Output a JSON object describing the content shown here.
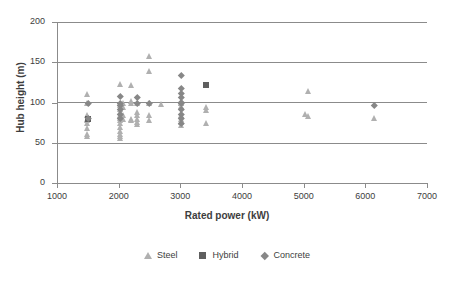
{
  "chart_data": {
    "type": "scatter",
    "title": "",
    "xlabel": "Rated power (kW)",
    "ylabel": "Hub height (m)",
    "xlim": [
      1000,
      7000
    ],
    "ylim": [
      0,
      200
    ],
    "xticks": [
      1000,
      2000,
      3000,
      4000,
      5000,
      6000,
      7000
    ],
    "yticks": [
      0,
      50,
      100,
      150,
      200
    ],
    "xtick_labels": [
      "1000",
      "2000",
      "3000",
      "4000",
      "5000",
      "6000",
      "7000"
    ],
    "ytick_labels": [
      "0",
      "50",
      "100",
      "150",
      "200"
    ],
    "grid": "horizontal",
    "legend_position": "bottom",
    "series": [
      {
        "name": "Steel",
        "marker": "triangle",
        "color": "#b0b0b0",
        "points": [
          [
            1500,
            110
          ],
          [
            1500,
            99
          ],
          [
            1500,
            85
          ],
          [
            1500,
            80
          ],
          [
            1500,
            78
          ],
          [
            1500,
            74
          ],
          [
            1500,
            68
          ],
          [
            1500,
            61
          ],
          [
            1500,
            59
          ],
          [
            2020,
            123
          ],
          [
            2020,
            100
          ],
          [
            2020,
            97
          ],
          [
            2020,
            92
          ],
          [
            2020,
            88
          ],
          [
            2020,
            85
          ],
          [
            2020,
            81
          ],
          [
            2020,
            78
          ],
          [
            2020,
            74
          ],
          [
            2020,
            69
          ],
          [
            2020,
            64
          ],
          [
            2020,
            61
          ],
          [
            2020,
            58
          ],
          [
            2020,
            56
          ],
          [
            2080,
            99
          ],
          [
            2080,
            94
          ],
          [
            2080,
            85
          ],
          [
            2080,
            80
          ],
          [
            2200,
            122
          ],
          [
            2200,
            102
          ],
          [
            2200,
            99
          ],
          [
            2200,
            80
          ],
          [
            2200,
            78
          ],
          [
            2300,
            99
          ],
          [
            2300,
            88
          ],
          [
            2300,
            85
          ],
          [
            2300,
            80
          ],
          [
            2300,
            76
          ],
          [
            2300,
            73
          ],
          [
            2500,
            158
          ],
          [
            2500,
            139
          ],
          [
            2500,
            99
          ],
          [
            2500,
            85
          ],
          [
            2500,
            78
          ],
          [
            2700,
            98
          ],
          [
            3020,
            100
          ],
          [
            3020,
            99
          ],
          [
            3020,
            96
          ],
          [
            3020,
            85
          ],
          [
            3020,
            80
          ],
          [
            3020,
            76
          ],
          [
            3020,
            72
          ],
          [
            3420,
            94
          ],
          [
            3420,
            91
          ],
          [
            3420,
            75
          ],
          [
            5080,
            114
          ],
          [
            5030,
            86
          ],
          [
            5080,
            83
          ],
          [
            6150,
            81
          ]
        ]
      },
      {
        "name": "Hybrid",
        "marker": "square",
        "color": "#5f5f5f",
        "points": [
          [
            1500,
            80
          ],
          [
            3420,
            122
          ]
        ]
      },
      {
        "name": "Concrete",
        "marker": "diamond",
        "color": "#878787",
        "points": [
          [
            1500,
            99
          ],
          [
            1500,
            80
          ],
          [
            2020,
            108
          ],
          [
            2020,
            99
          ],
          [
            2020,
            97
          ],
          [
            2020,
            92
          ],
          [
            2020,
            85
          ],
          [
            2020,
            80
          ],
          [
            2300,
            107
          ],
          [
            2300,
            99
          ],
          [
            2500,
            99
          ],
          [
            3020,
            134
          ],
          [
            3020,
            118
          ],
          [
            3020,
            112
          ],
          [
            3020,
            107
          ],
          [
            3020,
            100
          ],
          [
            3020,
            99
          ],
          [
            3020,
            92
          ],
          [
            3020,
            85
          ],
          [
            3020,
            80
          ],
          [
            3020,
            74
          ],
          [
            6150,
            96
          ]
        ]
      }
    ]
  }
}
